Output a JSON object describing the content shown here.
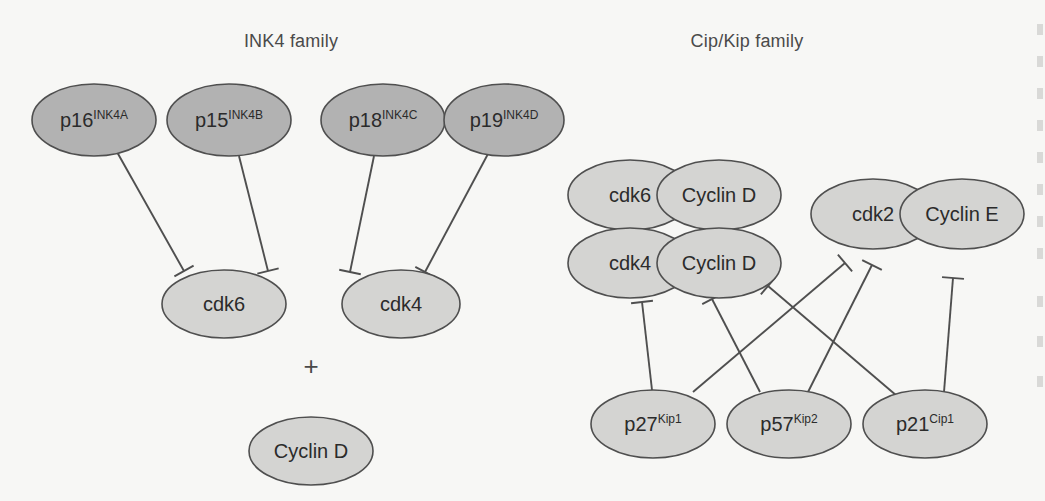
{
  "figure": {
    "background_color": "#f7f7f5",
    "width": 1045,
    "height": 501
  },
  "titles": [
    {
      "id": "ink4-family-title",
      "text": "INK4 family",
      "x": 291,
      "y": 41
    },
    {
      "id": "cipkip-family-title",
      "text": "Cip/Kip family",
      "x": 747,
      "y": 41
    }
  ],
  "symbols": [
    {
      "id": "plus-operator",
      "text": "+",
      "x": 311,
      "y": 366
    }
  ],
  "styles": {
    "ink4_fill": "#b2b2b2",
    "complex_fill": "#d4d4d2",
    "node_stroke": "#4f4f4f",
    "line_color": "#4f4f4f",
    "text_color": "#2b2b2b",
    "title_color": "#4a4a4a"
  },
  "nodes": [
    {
      "id": "p16",
      "label": "p16",
      "sup": "INK4A",
      "cx": 94,
      "cy": 120,
      "rx": 62,
      "ry": 36,
      "fill": "#b2b2b2",
      "group": "INK4 family"
    },
    {
      "id": "p15",
      "label": "p15",
      "sup": "INK4B",
      "cx": 229,
      "cy": 120,
      "rx": 62,
      "ry": 36,
      "fill": "#b2b2b2",
      "group": "INK4 family"
    },
    {
      "id": "p18",
      "label": "p18",
      "sup": "INK4C",
      "cx": 383,
      "cy": 120,
      "rx": 62,
      "ry": 36,
      "fill": "#b2b2b2",
      "group": "INK4 family"
    },
    {
      "id": "p19",
      "label": "p19",
      "sup": "INK4D",
      "cx": 504,
      "cy": 120,
      "rx": 60,
      "ry": 36,
      "fill": "#b2b2b2",
      "group": "INK4 family"
    },
    {
      "id": "cdk6-left",
      "label": "cdk6",
      "sup": "",
      "cx": 224,
      "cy": 304,
      "rx": 62,
      "ry": 34,
      "fill": "#d4d4d2",
      "group": "INK4 target"
    },
    {
      "id": "cdk4-left",
      "label": "cdk4",
      "sup": "",
      "cx": 401,
      "cy": 304,
      "rx": 59,
      "ry": 34,
      "fill": "#d4d4d2",
      "group": "INK4 target"
    },
    {
      "id": "cyclind-left",
      "label": "Cyclin D",
      "sup": "",
      "cx": 311,
      "cy": 451,
      "rx": 62,
      "ry": 34,
      "fill": "#d4d4d2",
      "group": "INK4 target"
    },
    {
      "id": "cdk6-complex-cdk",
      "label": "cdk6",
      "sup": "",
      "cx": 630,
      "cy": 195,
      "rx": 62,
      "ry": 35,
      "fill": "#d4d4d2",
      "group": "cdk6-CyclinD complex"
    },
    {
      "id": "cdk6-complex-cyclin",
      "label": "Cyclin D",
      "sup": "",
      "cx": 719,
      "cy": 195,
      "rx": 62,
      "ry": 35,
      "fill": "#d4d4d2",
      "group": "cdk6-CyclinD complex"
    },
    {
      "id": "cdk4-complex-cdk",
      "label": "cdk4",
      "sup": "",
      "cx": 630,
      "cy": 263,
      "rx": 62,
      "ry": 35,
      "fill": "#d4d4d2",
      "group": "cdk4-CyclinD complex"
    },
    {
      "id": "cdk4-complex-cyclin",
      "label": "Cyclin D",
      "sup": "",
      "cx": 719,
      "cy": 263,
      "rx": 62,
      "ry": 35,
      "fill": "#d4d4d2",
      "group": "cdk4-CyclinD complex"
    },
    {
      "id": "cdk2-complex-cdk",
      "label": "cdk2",
      "sup": "",
      "cx": 873,
      "cy": 214,
      "rx": 62,
      "ry": 35,
      "fill": "#d4d4d2",
      "group": "cdk2-CyclinE complex"
    },
    {
      "id": "cdk2-complex-cyclin",
      "label": "Cyclin E",
      "sup": "",
      "cx": 962,
      "cy": 214,
      "rx": 62,
      "ry": 35,
      "fill": "#d4d4d2",
      "group": "cdk2-CyclinE complex"
    },
    {
      "id": "p27",
      "label": "p27",
      "sup": "Kip1",
      "cx": 653,
      "cy": 424,
      "rx": 62,
      "ry": 34,
      "fill": "#d4d4d2",
      "group": "Cip/Kip family"
    },
    {
      "id": "p57",
      "label": "p57",
      "sup": "Kip2",
      "cx": 789,
      "cy": 424,
      "rx": 62,
      "ry": 34,
      "fill": "#d4d4d2",
      "group": "Cip/Kip family"
    },
    {
      "id": "p21",
      "label": "p21",
      "sup": "Cip1",
      "cx": 925,
      "cy": 424,
      "rx": 62,
      "ry": 34,
      "fill": "#d4d4d2",
      "group": "Cip/Kip family"
    }
  ],
  "edges": [
    {
      "id": "p16-inhibits-cdk6",
      "from": "p16",
      "to": "cdk6-left",
      "type": "inhibition",
      "x1": 117,
      "y1": 152,
      "x2": 184,
      "y2": 271
    },
    {
      "id": "p15-inhibits-cdk6",
      "from": "p15",
      "to": "cdk6-left",
      "type": "inhibition",
      "x1": 239,
      "y1": 156,
      "x2": 268,
      "y2": 271
    },
    {
      "id": "p18-inhibits-cdk4",
      "from": "p18",
      "to": "cdk4-left",
      "type": "inhibition",
      "x1": 374,
      "y1": 156,
      "x2": 350,
      "y2": 272
    },
    {
      "id": "p19-inhibits-cdk4",
      "from": "p19",
      "to": "cdk4-left",
      "type": "inhibition",
      "x1": 489,
      "y1": 152,
      "x2": 425,
      "y2": 272
    },
    {
      "id": "p27-inhibits-cdk4-cyclind",
      "from": "p27",
      "to": "cdk4-complex-cdk",
      "type": "inhibition",
      "x1": 652,
      "y1": 390,
      "x2": 642,
      "y2": 302
    },
    {
      "id": "p27-inhibits-cdk2-cycline",
      "from": "p27",
      "to": "cdk2-complex-cdk",
      "type": "inhibition",
      "x1": 693,
      "y1": 392,
      "x2": 845,
      "y2": 263
    },
    {
      "id": "p57-inhibits-cdk4-cyclind",
      "from": "p57",
      "to": "cdk4-complex-cyclin",
      "type": "inhibition",
      "x1": 760,
      "y1": 392,
      "x2": 712,
      "y2": 299
    },
    {
      "id": "p57-inhibits-cdk2-cycline",
      "from": "p57",
      "to": "cdk2-complex-cdk",
      "type": "inhibition",
      "x1": 808,
      "y1": 392,
      "x2": 872,
      "y2": 265
    },
    {
      "id": "p21-inhibits-cdk4-cyclind",
      "from": "p21",
      "to": "cdk4-complex-cyclin",
      "type": "inhibition",
      "x1": 897,
      "y1": 396,
      "x2": 768,
      "y2": 286
    },
    {
      "id": "p21-inhibits-cdk2-cycline",
      "from": "p21",
      "to": "cdk2-complex-cyclin",
      "type": "inhibition",
      "x1": 944,
      "y1": 392,
      "x2": 953,
      "y2": 278
    }
  ],
  "edge_fragments": [
    {
      "y": 24
    },
    {
      "y": 56
    },
    {
      "y": 88
    },
    {
      "y": 120
    },
    {
      "y": 152
    },
    {
      "y": 184
    },
    {
      "y": 216
    },
    {
      "y": 248
    },
    {
      "y": 296
    },
    {
      "y": 336
    },
    {
      "y": 376
    }
  ]
}
